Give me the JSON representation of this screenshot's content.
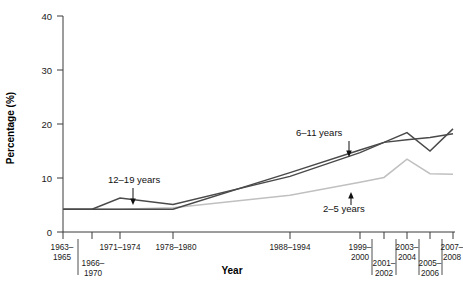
{
  "chart_data": {
    "type": "line",
    "title": "",
    "xlabel": "Year",
    "ylabel": "Percentage (%)",
    "ylim": [
      0,
      40
    ],
    "yticks": [
      0,
      10,
      20,
      30,
      40
    ],
    "ytick_labels": [
      "0",
      "10",
      "20",
      "30",
      "40"
    ],
    "grid": false,
    "legend_position": "inline-annotations",
    "categories": [
      "1963–1965",
      "1966–1970",
      "1971–1974",
      "1976–1980",
      "1988–1994",
      "1999–2000",
      "2001–2002",
      "2003–2004",
      "2005–2006",
      "2007–2008"
    ],
    "xtick_labels": [
      {
        "line1": "1963–",
        "line2": "1965",
        "row": "top"
      },
      {
        "line1": "1966–",
        "line2": "1970",
        "row": "bottom"
      },
      {
        "line1": "1971–1974",
        "line2": "",
        "row": "top"
      },
      {
        "line1": "1978–1980",
        "line2": "",
        "row": "top"
      },
      {
        "line1": "1988–1994",
        "line2": "",
        "row": "top"
      },
      {
        "line1": "1999–",
        "line2": "2000",
        "row": "top"
      },
      {
        "line1": "2001–",
        "line2": "2002",
        "row": "bottom"
      },
      {
        "line1": "2003–",
        "line2": "2004",
        "row": "top"
      },
      {
        "line1": "2005–",
        "line2": "2006",
        "row": "bottom"
      },
      {
        "line1": "2007–",
        "line2": "2008",
        "row": "top"
      }
    ],
    "series": [
      {
        "name": "2–5 years",
        "color": "#c0c0c0",
        "label": "2–5 years",
        "values": [
          4.2,
          4.2,
          4.2,
          4.5,
          6.8,
          9.2,
          10.1,
          13.5,
          10.8,
          10.7
        ]
      },
      {
        "name": "6–11 years",
        "color": "#4a4a4a",
        "label": "6–11 years",
        "values": [
          4.2,
          4.2,
          4.2,
          4.2,
          11.0,
          15.2,
          16.6,
          18.4,
          15.0,
          19.1
        ]
      },
      {
        "name": "12–19 years",
        "color": "#4a4a4a",
        "label": "12–19 years",
        "values": [
          4.2,
          4.2,
          6.3,
          5.1,
          10.3,
          14.7,
          16.6,
          17.1,
          17.5,
          18.2
        ]
      }
    ],
    "annotations": [
      {
        "text": "12–19 years",
        "arrow": "down",
        "target_series": "12–19 years"
      },
      {
        "text": "6–11 years",
        "arrow": "down",
        "target_series": "6–11 years"
      },
      {
        "text": "2–5 years",
        "arrow": "up",
        "target_series": "2–5 years"
      }
    ]
  }
}
